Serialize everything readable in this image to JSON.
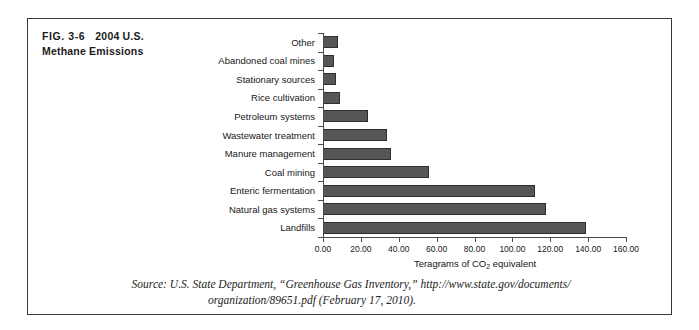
{
  "figure": {
    "number": "FIG. 3-6",
    "title_line1": "2004 U.S.",
    "title_line2": "Methane Emissions"
  },
  "source": {
    "line1": "Source: U.S. State Department, “Greenhouse Gas Inventory,” http://www.state.gov/documents/",
    "line2": "organization/89651.pdf (February 17, 2010)."
  },
  "style": {
    "bar_fill": "#565656",
    "bar_stroke": "#2e2e2e",
    "frame_color": "#3a3a3a",
    "axis_color": "#4a4a4a"
  },
  "chart_data": {
    "type": "bar",
    "orientation": "horizontal",
    "title": "2004 U.S. Methane Emissions",
    "xlabel": "Teragrams of CO2 equivalent",
    "ylabel": "",
    "xlim": [
      0,
      160
    ],
    "xticks": [
      0,
      20,
      40,
      60,
      80,
      100,
      120,
      140,
      160
    ],
    "xtick_labels": [
      "0.00",
      "20.00",
      "40.00",
      "60.00",
      "80.00",
      "100.00",
      "120.00",
      "140.00",
      "160.00"
    ],
    "grid": false,
    "legend": false,
    "categories": [
      "Other",
      "Abandoned coal mines",
      "Stationary sources",
      "Rice cultivation",
      "Petroleum systems",
      "Wastewater treatment",
      "Manure management",
      "Coal mining",
      "Enteric fermentation",
      "Natural gas systems",
      "Landfills"
    ],
    "values": [
      8,
      6,
      7,
      9,
      24,
      34,
      36,
      56,
      112,
      118,
      139
    ]
  }
}
